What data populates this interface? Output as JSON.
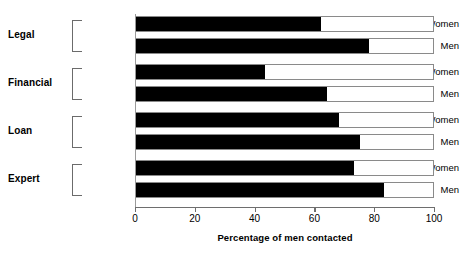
{
  "chart_data": {
    "type": "bar",
    "orientation": "horizontal",
    "title": "",
    "xlabel": "Percentage of men contacted",
    "ylabel": "",
    "xlim": [
      0,
      100
    ],
    "xticks": [
      0,
      20,
      40,
      60,
      80,
      100
    ],
    "grid": false,
    "legend": "none",
    "bar_style": {
      "fill_color": "#000000",
      "remainder_color": "#ffffff",
      "outline_color": "#8a8a8a",
      "note": "each bar is drawn full width to 100 with an outlined box; black segment shows the value"
    },
    "groups": [
      {
        "label": "Legal",
        "rows": [
          {
            "label": "Women",
            "value": 62
          },
          {
            "label": "Men",
            "value": 78
          }
        ]
      },
      {
        "label": "Financial",
        "rows": [
          {
            "label": "Women",
            "value": 43
          },
          {
            "label": "Men",
            "value": 64
          }
        ]
      },
      {
        "label": "Loan",
        "rows": [
          {
            "label": "Women",
            "value": 68
          },
          {
            "label": "Men",
            "value": 75
          }
        ]
      },
      {
        "label": "Expert",
        "rows": [
          {
            "label": "Women",
            "value": 73
          },
          {
            "label": "Men",
            "value": 83
          }
        ]
      }
    ],
    "categories": [
      "Legal Women",
      "Legal Men",
      "Financial Women",
      "Financial Men",
      "Loan Women",
      "Loan Men",
      "Expert Women",
      "Expert Men"
    ],
    "values": [
      62,
      78,
      43,
      64,
      68,
      75,
      73,
      83
    ]
  }
}
